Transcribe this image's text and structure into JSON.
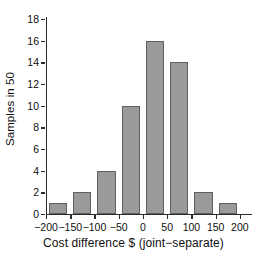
{
  "chart_data": {
    "type": "bar",
    "title": "",
    "subtitle": "",
    "xlabel": "Cost difference $ (joint−separate)",
    "ylabel": "Samples in 50",
    "categories": [
      "-200 to -150",
      "-150 to -100",
      "-100 to -50",
      "-50 to 0",
      "0 to 50",
      "50 to 100",
      "100 to 150",
      "150 to 200"
    ],
    "bin_edges": [
      -200,
      -150,
      -100,
      -50,
      0,
      50,
      100,
      150,
      200
    ],
    "values": [
      1,
      2,
      4,
      10,
      16,
      14,
      2,
      1
    ],
    "x_tick_labels": [
      "−200",
      "−150",
      "−100",
      "−50",
      "0",
      "50",
      "100",
      "150",
      "200"
    ],
    "x_tick_values": [
      -200,
      -150,
      -100,
      -50,
      0,
      50,
      100,
      150,
      200
    ],
    "y_tick_labels": [
      "0",
      "2",
      "4",
      "6",
      "8",
      "10",
      "12",
      "14",
      "16",
      "18"
    ],
    "y_tick_values": [
      0,
      2,
      4,
      6,
      8,
      10,
      12,
      14,
      16,
      18
    ],
    "xlim": [
      -200,
      225
    ],
    "ylim": [
      0,
      18
    ],
    "grid": false,
    "legend": false,
    "legend_position": "none",
    "bar_fill_color": "#9a9a9a",
    "bar_edge_color": "#5f5f5f",
    "axis_color": "#2b2b2b",
    "text_color": "#101010",
    "background_color": "#ffffff"
  }
}
